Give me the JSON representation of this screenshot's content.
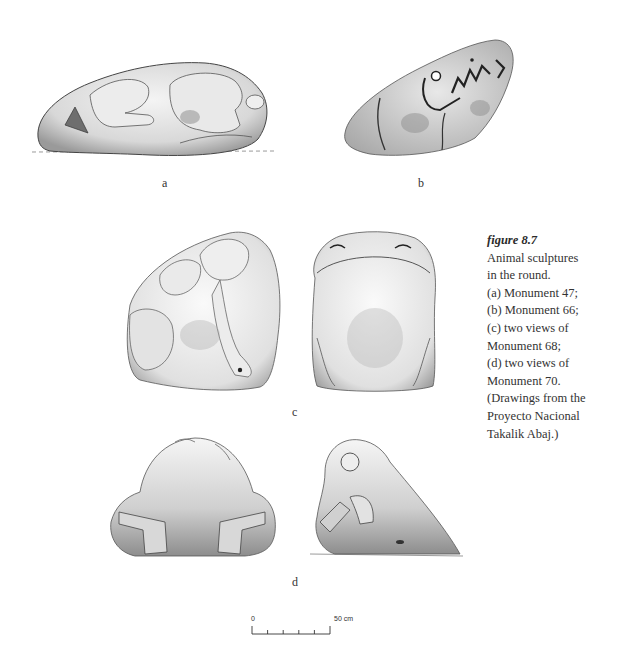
{
  "figure": {
    "number": "figure 8.7",
    "caption_lines": [
      "Animal sculptures",
      "in the round.",
      "(a) Monument 47;",
      "(b) Monument 66;",
      "(c) two views of",
      "Monument 68;",
      "(d) two views of",
      "Monument 70.",
      "(Drawings from the",
      "Proyecto Nacional",
      "Takalik Abaj.)"
    ]
  },
  "panels": {
    "a": {
      "label": "a",
      "subject": "Monument 47"
    },
    "b": {
      "label": "b",
      "subject": "Monument 66"
    },
    "c": {
      "label": "c",
      "subject": "Monument 68 (two views)"
    },
    "d": {
      "label": "d",
      "subject": "Monument 70 (two views)"
    }
  },
  "scale_bar": {
    "start_label": "0",
    "end_label": "50 cm",
    "ticks": 6
  },
  "colors": {
    "ink": "#2a2a2a",
    "stone_shade": "#8a8a8a",
    "stone_light": "#e6e6e6",
    "background": "#ffffff"
  }
}
